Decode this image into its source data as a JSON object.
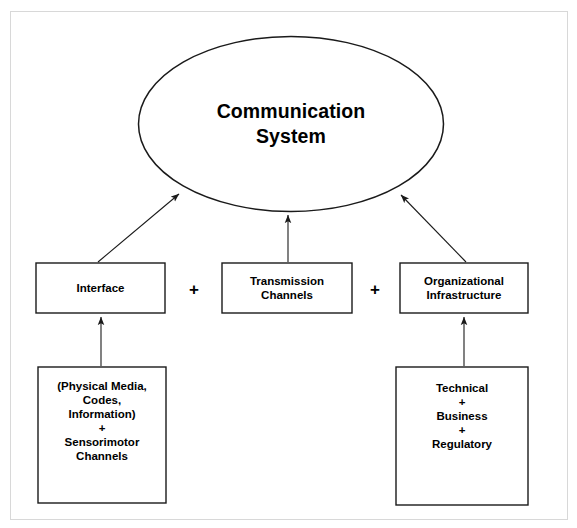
{
  "diagram": {
    "title": "Communication System",
    "frame": {
      "border_color": "#d8d8d8",
      "background": "#ffffff"
    },
    "stroke_color": "#1a1a1a",
    "text_color": "#000000",
    "root": {
      "shape": "ellipse",
      "name": "communication-system",
      "label": "Communication\nSystem",
      "line1": "Communication",
      "line2": "System"
    },
    "components": [
      {
        "name": "interface",
        "shape": "rectangle",
        "label": "Interface",
        "detail_name": "interface-detail",
        "detail_lines": [
          "(Physical Media,",
          "Codes,",
          "Information)",
          "+",
          "Sensorimotor",
          "Channels"
        ]
      },
      {
        "name": "transmission-channels",
        "shape": "rectangle",
        "label": "Transmission\nChannels",
        "line1": "Transmission",
        "line2": "Channels",
        "detail_name": null,
        "detail_lines": []
      },
      {
        "name": "organizational-infrastructure",
        "shape": "rectangle",
        "label": "Organizational\nInfrastructure",
        "line1": "Organizational",
        "line2": "Infrastructure",
        "detail_name": "organizational-detail",
        "detail_lines": [
          "Technical",
          "+",
          "Business",
          "+",
          "Regulatory"
        ]
      }
    ],
    "operators": [
      {
        "name": "plus-operator-left",
        "symbol": "+"
      },
      {
        "name": "plus-operator-right",
        "symbol": "+"
      }
    ],
    "connections": [
      {
        "name": "arrow-interface-to-system",
        "from": "interface",
        "to": "communication-system",
        "style": "diagonal-arrow"
      },
      {
        "name": "arrow-transmission-to-system",
        "from": "transmission-channels",
        "to": "communication-system",
        "style": "vertical-arrow"
      },
      {
        "name": "arrow-organizational-to-system",
        "from": "organizational-infrastructure",
        "to": "communication-system",
        "style": "diagonal-arrow"
      },
      {
        "name": "arrow-media-to-interface",
        "from": "interface-detail",
        "to": "interface",
        "style": "vertical-arrow"
      },
      {
        "name": "arrow-technical-to-organizational",
        "from": "organizational-detail",
        "to": "organizational-infrastructure",
        "style": "vertical-arrow"
      }
    ]
  }
}
